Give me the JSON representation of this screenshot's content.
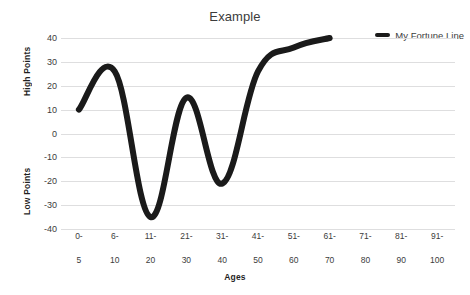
{
  "chart_data": {
    "type": "line",
    "title": "Example",
    "xlabel": "Ages",
    "ylabel_high": "High Points",
    "ylabel_low": "Low Points",
    "grid": true,
    "legend_position": "top-right",
    "ylim": [
      -40,
      40
    ],
    "yticks": [
      40,
      30,
      20,
      10,
      0,
      -10,
      -20,
      -30,
      -40
    ],
    "categories": [
      "0-\n5",
      "6-\n10",
      "11-\n20",
      "21-\n30",
      "31-\n40",
      "41-\n50",
      "51-\n60",
      "61-\n70",
      "71-\n80",
      "81-\n90",
      "91-\n100"
    ],
    "category_lines": [
      [
        "0-",
        "5"
      ],
      [
        "6-",
        "10"
      ],
      [
        "11-",
        "20"
      ],
      [
        "21-",
        "30"
      ],
      [
        "31-",
        "40"
      ],
      [
        "41-",
        "50"
      ],
      [
        "51-",
        "60"
      ],
      [
        "61-",
        "70"
      ],
      [
        "71-",
        "80"
      ],
      [
        "81-",
        "90"
      ],
      [
        "91-",
        "100"
      ]
    ],
    "series": [
      {
        "name": "My Fortune Line",
        "color": "#1a1a1a",
        "x": [
          "0-5",
          "6-10",
          "11-20",
          "21-30",
          "31-40",
          "41-50",
          "51-60",
          "61-70"
        ],
        "values": [
          10,
          26,
          -35,
          15,
          -21,
          26,
          36,
          40
        ]
      }
    ],
    "line_color": "#1a1a1a",
    "grid_color": "#dededf",
    "text_color": "#3c3c3c"
  },
  "legend": {
    "entries": [
      {
        "label": "My Fortune Line"
      }
    ]
  },
  "axes": {
    "y_ticks": [
      "40",
      "30",
      "20",
      "10",
      "0",
      "-10",
      "-20",
      "-30",
      "-40"
    ],
    "y_title_upper": "High Points",
    "y_title_lower": "Low Points",
    "x_title": "Ages",
    "x_ticks": [
      {
        "top": "0-",
        "bottom": "5"
      },
      {
        "top": "6-",
        "bottom": "10"
      },
      {
        "top": "11-",
        "bottom": "20"
      },
      {
        "top": "21-",
        "bottom": "30"
      },
      {
        "top": "31-",
        "bottom": "40"
      },
      {
        "top": "41-",
        "bottom": "50"
      },
      {
        "top": "51-",
        "bottom": "60"
      },
      {
        "top": "61-",
        "bottom": "70"
      },
      {
        "top": "71-",
        "bottom": "80"
      },
      {
        "top": "81-",
        "bottom": "90"
      },
      {
        "top": "91-",
        "bottom": "100"
      }
    ]
  },
  "header": {
    "title": "Example"
  }
}
